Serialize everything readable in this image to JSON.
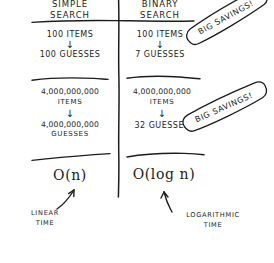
{
  "diagram": {
    "title_left": "SIMPLE",
    "title_left_2": "SEARCH",
    "title_right": "BINARY",
    "title_right_2": "BINARY_SEARCH_LINE2",
    "columns": [
      {
        "name": "simple-search",
        "header_line1": "SIMPLE",
        "header_line2": "SEARCH",
        "rows": [
          {
            "input": "100 ITEMS",
            "arrow": "↓",
            "output": "100 GUESSES"
          },
          {
            "input": "4,000,000,000",
            "input_unit": "ITEMS",
            "arrow": "↓",
            "output": "4,000,000,000",
            "output_unit": "GUESSES"
          }
        ],
        "complexity": "O(n)",
        "annotation_line1": "LINEAR",
        "annotation_line2": "TIME"
      },
      {
        "name": "binary-search",
        "header_line1": "BINARY",
        "header_line2": "SEARCH",
        "rows": [
          {
            "input": "100 ITEMS",
            "arrow": "↓",
            "output": "7 GUESSES"
          },
          {
            "input": "4,000,000,000",
            "input_unit": "ITEMS",
            "arrow": "↓",
            "output": "32 GUESSES",
            "output_unit": ""
          }
        ],
        "complexity": "O(log n)",
        "annotation_line1": "LOGARITHMIC",
        "annotation_line2": "TIME"
      }
    ],
    "banners": [
      {
        "name": "big-savings-banner-1",
        "text": "BIG SAVINGS!"
      },
      {
        "name": "big-savings-banner-2",
        "text": "BIG SAVINGS!"
      }
    ],
    "colors": {
      "ink": "#1d1d1d",
      "background": "#ffffff"
    }
  }
}
